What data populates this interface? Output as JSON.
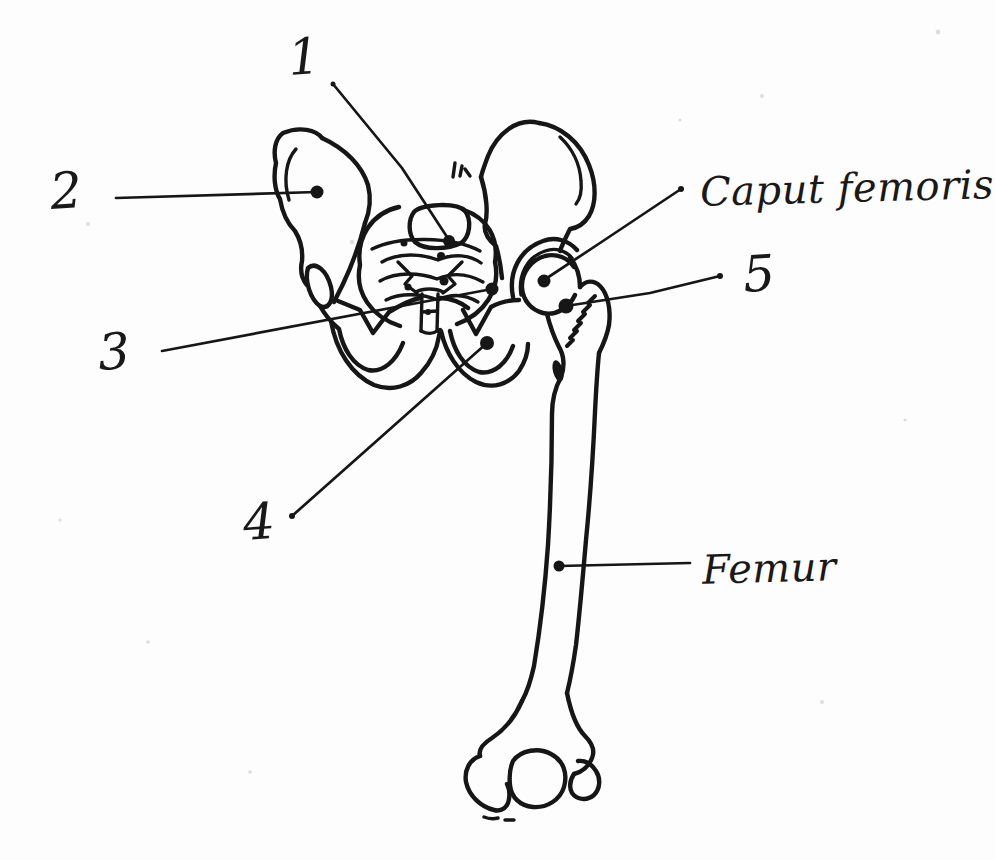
{
  "figure": {
    "ink_color": "#161616",
    "paper_color": "#fdfdfd",
    "labels": {
      "n1": "1",
      "n2": "2",
      "n3": "3",
      "n4": "4",
      "n5": "5",
      "caput_femoris": "Caput femoris",
      "femur": "Femur"
    }
  }
}
